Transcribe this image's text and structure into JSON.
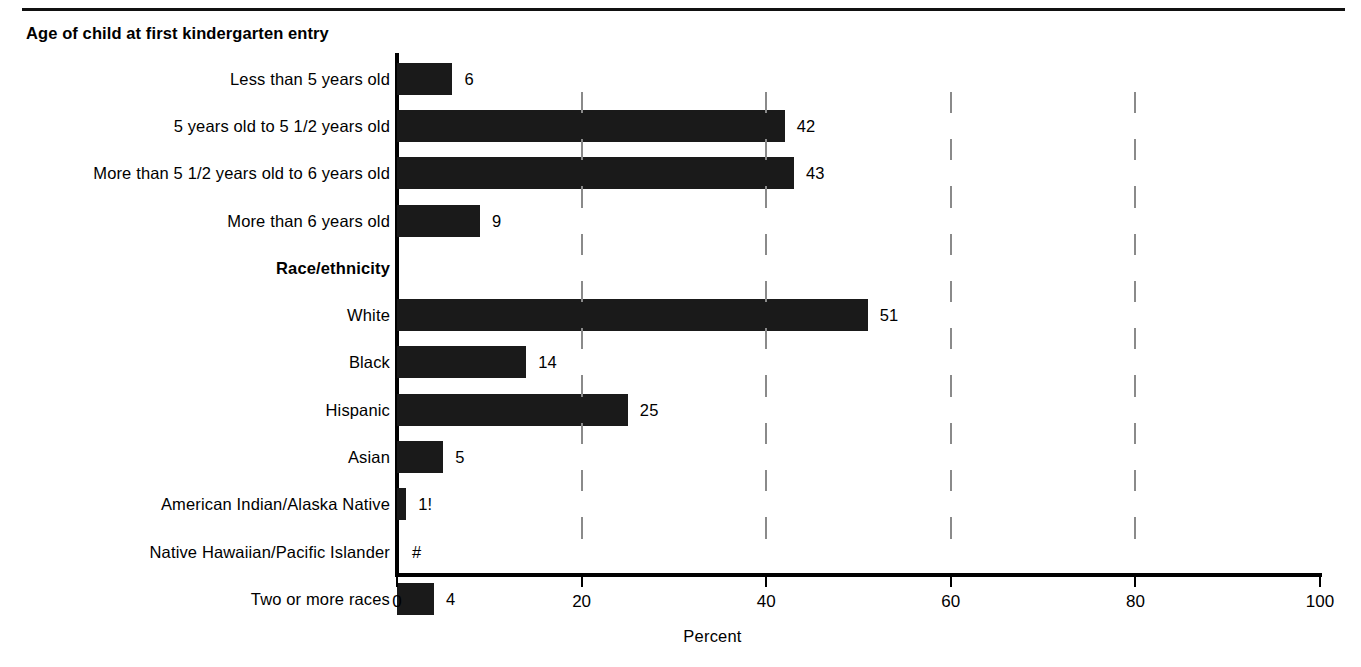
{
  "chart_data": {
    "type": "bar",
    "orientation": "horizontal",
    "title": "",
    "xlabel": "Percent",
    "ylabel": "",
    "xlim": [
      0,
      100
    ],
    "xticks": [
      "0",
      "20",
      "40",
      "60",
      "80",
      "100"
    ],
    "grid": "vertical-dashed",
    "legend": "none",
    "groups": [
      {
        "heading": "Age of child at first kindergarten entry",
        "categories": [
          "Less than 5 years old",
          "5 years old to 5 1/2 years old",
          "More than 5 1/2 years old to 6 years old",
          "More than 6 years old"
        ],
        "values": [
          6,
          42,
          43,
          9
        ],
        "labels": [
          "6",
          "42",
          "43",
          "9"
        ]
      },
      {
        "heading": "Race/ethnicity",
        "categories": [
          "White",
          "Black",
          "Hispanic",
          "Asian",
          "American Indian/Alaska Native",
          "Native Hawaiian/Pacific Islander",
          "Two or more races"
        ],
        "values": [
          51,
          14,
          25,
          5,
          1,
          0,
          4
        ],
        "labels": [
          "51",
          "14",
          "25",
          "5",
          "1!",
          "#",
          "4"
        ]
      }
    ]
  },
  "heading_age": "Age of child at first kindergarten entry",
  "heading_race": "Race/ethnicity",
  "rows": [
    {
      "label": "Less than 5 years old",
      "value": 6,
      "display": "6",
      "group": false
    },
    {
      "label": "5 years old to 5 1/2 years old",
      "value": 42,
      "display": "42",
      "group": false
    },
    {
      "label": "More than 5 1/2 years old to 6 years old",
      "value": 43,
      "display": "43",
      "group": false
    },
    {
      "label": "More than 6 years old",
      "value": 9,
      "display": "9",
      "group": false
    },
    {
      "label": "Race/ethnicity",
      "value": 0,
      "display": "",
      "group": true
    },
    {
      "label": "White",
      "value": 51,
      "display": "51",
      "group": false
    },
    {
      "label": "Black",
      "value": 14,
      "display": "14",
      "group": false
    },
    {
      "label": "Hispanic",
      "value": 25,
      "display": "25",
      "group": false
    },
    {
      "label": "Asian",
      "value": 5,
      "display": "5",
      "group": false
    },
    {
      "label": "American Indian/Alaska Native",
      "value": 1,
      "display": "1!",
      "group": false
    },
    {
      "label": "Native Hawaiian/Pacific Islander",
      "value": 0,
      "display": "#",
      "group": false
    },
    {
      "label": "Two or more races",
      "value": 4,
      "display": "4",
      "group": false
    }
  ],
  "axis": {
    "title": "Percent",
    "ticks": [
      "0",
      "20",
      "40",
      "60",
      "80",
      "100"
    ],
    "tick_values": [
      0,
      20,
      40,
      60,
      80,
      100
    ]
  },
  "colors": {
    "bar": "#1a1a1a",
    "axis": "#000000",
    "gridline": "#8a8a8a",
    "background": "#ffffff",
    "text": "#000000"
  }
}
